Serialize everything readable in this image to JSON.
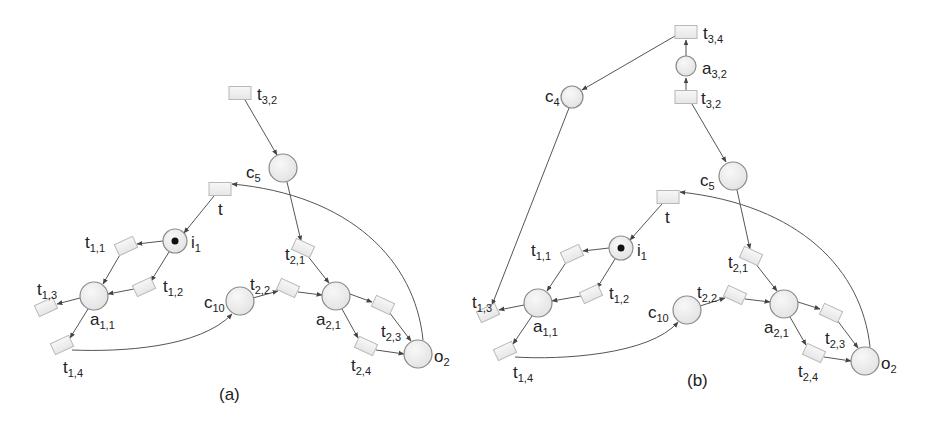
{
  "figure": {
    "panels": [
      {
        "id": "a",
        "caption": "(a)",
        "caption_pos": [
          219,
          400
        ],
        "places": [
          {
            "id": "i1",
            "label": "i",
            "sub": "1",
            "x": 175,
            "y": 241,
            "r": 12,
            "token": true,
            "lx": 191,
            "ly": 248
          },
          {
            "id": "c5",
            "label": "c",
            "sub": "5",
            "x": 283,
            "y": 168,
            "r": 14,
            "token": false,
            "lx": 246,
            "ly": 178
          },
          {
            "id": "a11",
            "label": "a",
            "sub": "1,1",
            "x": 94,
            "y": 296,
            "r": 14,
            "token": false,
            "lx": 90,
            "ly": 325
          },
          {
            "id": "c10",
            "label": "c",
            "sub": "10",
            "x": 240,
            "y": 301,
            "r": 14,
            "token": false,
            "lx": 204,
            "ly": 308
          },
          {
            "id": "a21",
            "label": "a",
            "sub": "2,1",
            "x": 336,
            "y": 296,
            "r": 14,
            "token": false,
            "lx": 316,
            "ly": 325
          },
          {
            "id": "o2",
            "label": "o",
            "sub": "2",
            "x": 418,
            "y": 354,
            "r": 14,
            "token": false,
            "lx": 434,
            "ly": 362
          }
        ],
        "transitions": [
          {
            "id": "t32",
            "label": "t",
            "sub": "3,2",
            "x": 240,
            "y": 93,
            "w": 22,
            "h": 13,
            "rot": 0,
            "lx": 257,
            "ly": 100
          },
          {
            "id": "t",
            "label": "t",
            "sub": "",
            "x": 220,
            "y": 189,
            "w": 22,
            "h": 13,
            "rot": 0,
            "lx": 218,
            "ly": 215
          },
          {
            "id": "t11",
            "label": "t",
            "sub": "1,1",
            "x": 126,
            "y": 246,
            "w": 20,
            "h": 12,
            "rot": -25,
            "lx": 85,
            "ly": 248
          },
          {
            "id": "t12",
            "label": "t",
            "sub": "1,2",
            "x": 144,
            "y": 287,
            "w": 20,
            "h": 12,
            "rot": -25,
            "lx": 163,
            "ly": 292
          },
          {
            "id": "t13",
            "label": "t",
            "sub": "1,3",
            "x": 46,
            "y": 307,
            "w": 20,
            "h": 12,
            "rot": -25,
            "lx": 37,
            "ly": 295
          },
          {
            "id": "t14",
            "label": "t",
            "sub": "1,4",
            "x": 62,
            "y": 345,
            "w": 20,
            "h": 12,
            "rot": -25,
            "lx": 63,
            "ly": 373
          },
          {
            "id": "t21",
            "label": "t",
            "sub": "2,1",
            "x": 303,
            "y": 248,
            "w": 20,
            "h": 12,
            "rot": 25,
            "lx": 285,
            "ly": 260
          },
          {
            "id": "t22",
            "label": "t",
            "sub": "2,2",
            "x": 288,
            "y": 288,
            "w": 20,
            "h": 12,
            "rot": 25,
            "lx": 250,
            "ly": 290
          },
          {
            "id": "t23",
            "label": "t",
            "sub": "2,3",
            "x": 383,
            "y": 305,
            "w": 20,
            "h": 12,
            "rot": 25,
            "lx": 381,
            "ly": 337
          },
          {
            "id": "t24",
            "label": "t",
            "sub": "2,4",
            "x": 366,
            "y": 346,
            "w": 20,
            "h": 12,
            "rot": 25,
            "lx": 351,
            "ly": 371
          }
        ],
        "arcs": [
          {
            "d": "M245,100 L277,155"
          },
          {
            "d": "M287,182 L301,241"
          },
          {
            "d": "M214,196 L184,233"
          },
          {
            "d": "M163,241 L137,244"
          },
          {
            "d": "M169,252 L151,281"
          },
          {
            "d": "M121,253 L103,284"
          },
          {
            "d": "M134,289 L108,294"
          },
          {
            "d": "M80,298 L57,304"
          },
          {
            "d": "M88,309 L70,338"
          },
          {
            "d": "M72,350 C120,352 200,348 232,314"
          },
          {
            "d": "M253,298 L278,291"
          },
          {
            "d": "M298,292 L322,295"
          },
          {
            "d": "M307,255 L329,283"
          },
          {
            "d": "M350,294 L372,302"
          },
          {
            "d": "M342,309 L358,338"
          },
          {
            "d": "M389,312 L411,341"
          },
          {
            "d": "M376,350 L404,354"
          },
          {
            "d": "M423,340 C415,260 350,195 232,184"
          }
        ]
      },
      {
        "id": "b",
        "caption": "(b)",
        "caption_pos": [
          687,
          386
        ],
        "places": [
          {
            "id": "i1",
            "label": "i",
            "sub": "1",
            "x": 621,
            "y": 248,
            "r": 12,
            "token": true,
            "lx": 637,
            "ly": 256
          },
          {
            "id": "c4",
            "label": "c",
            "sub": "4",
            "x": 572,
            "y": 97,
            "r": 11,
            "token": false,
            "lx": 545,
            "ly": 102
          },
          {
            "id": "a32",
            "label": "a",
            "sub": "3,2",
            "x": 686,
            "y": 66,
            "r": 10,
            "token": false,
            "lx": 702,
            "ly": 74
          },
          {
            "id": "c5",
            "label": "c",
            "sub": "5",
            "x": 733,
            "y": 176,
            "r": 14,
            "token": false,
            "lx": 700,
            "ly": 186
          },
          {
            "id": "a11",
            "label": "a",
            "sub": "1,1",
            "x": 538,
            "y": 303,
            "r": 14,
            "token": false,
            "lx": 533,
            "ly": 332
          },
          {
            "id": "c10",
            "label": "c",
            "sub": "10",
            "x": 687,
            "y": 310,
            "r": 14,
            "token": false,
            "lx": 648,
            "ly": 318
          },
          {
            "id": "a21",
            "label": "a",
            "sub": "2,1",
            "x": 784,
            "y": 304,
            "r": 14,
            "token": false,
            "lx": 764,
            "ly": 333
          },
          {
            "id": "o2",
            "label": "o",
            "sub": "2",
            "x": 865,
            "y": 361,
            "r": 14,
            "token": false,
            "lx": 881,
            "ly": 369
          }
        ],
        "transitions": [
          {
            "id": "t34",
            "label": "t",
            "sub": "3,4",
            "x": 686,
            "y": 32,
            "w": 22,
            "h": 13,
            "rot": 0,
            "lx": 703,
            "ly": 39
          },
          {
            "id": "t32",
            "label": "t",
            "sub": "3,2",
            "x": 686,
            "y": 97,
            "w": 22,
            "h": 13,
            "rot": 0,
            "lx": 701,
            "ly": 104
          },
          {
            "id": "t",
            "label": "t",
            "sub": "",
            "x": 668,
            "y": 197,
            "w": 22,
            "h": 13,
            "rot": 0,
            "lx": 665,
            "ly": 223
          },
          {
            "id": "t11",
            "label": "t",
            "sub": "1,1",
            "x": 572,
            "y": 254,
            "w": 20,
            "h": 12,
            "rot": -25,
            "lx": 531,
            "ly": 256
          },
          {
            "id": "t12",
            "label": "t",
            "sub": "1,2",
            "x": 591,
            "y": 294,
            "w": 20,
            "h": 12,
            "rot": -25,
            "lx": 609,
            "ly": 299
          },
          {
            "id": "t13",
            "label": "t",
            "sub": "1,3",
            "x": 488,
            "y": 313,
            "w": 20,
            "h": 12,
            "rot": -25,
            "lx": 472,
            "ly": 308
          },
          {
            "id": "t14",
            "label": "t",
            "sub": "1,4",
            "x": 505,
            "y": 351,
            "w": 20,
            "h": 12,
            "rot": -25,
            "lx": 513,
            "ly": 378
          },
          {
            "id": "t21",
            "label": "t",
            "sub": "2,1",
            "x": 751,
            "y": 256,
            "w": 20,
            "h": 12,
            "rot": 25,
            "lx": 728,
            "ly": 268
          },
          {
            "id": "t22",
            "label": "t",
            "sub": "2,2",
            "x": 735,
            "y": 295,
            "w": 20,
            "h": 12,
            "rot": 25,
            "lx": 697,
            "ly": 298
          },
          {
            "id": "t23",
            "label": "t",
            "sub": "2,3",
            "x": 831,
            "y": 313,
            "w": 20,
            "h": 12,
            "rot": 25,
            "lx": 825,
            "ly": 344
          },
          {
            "id": "t24",
            "label": "t",
            "sub": "2,4",
            "x": 814,
            "y": 353,
            "w": 20,
            "h": 12,
            "rot": 25,
            "lx": 798,
            "ly": 377
          }
        ],
        "arcs": [
          {
            "d": "M675,36 L582,90"
          },
          {
            "d": "M686,56 L686,40"
          },
          {
            "d": "M686,90 L686,78"
          },
          {
            "d": "M692,104 L726,162"
          },
          {
            "d": "M737,190 L750,249"
          },
          {
            "d": "M569,108 L492,305"
          },
          {
            "d": "M662,204 L630,240"
          },
          {
            "d": "M609,248 L583,251"
          },
          {
            "d": "M615,259 L597,288"
          },
          {
            "d": "M567,261 L547,291"
          },
          {
            "d": "M581,296 L552,301"
          },
          {
            "d": "M524,305 L499,310"
          },
          {
            "d": "M532,316 L513,344"
          },
          {
            "d": "M515,357 C560,360 650,355 678,322"
          },
          {
            "d": "M700,306 L725,298"
          },
          {
            "d": "M745,299 L770,302"
          },
          {
            "d": "M755,263 L777,291"
          },
          {
            "d": "M798,302 L820,309"
          },
          {
            "d": "M790,317 L806,345"
          },
          {
            "d": "M837,320 L858,348"
          },
          {
            "d": "M824,357 L851,361"
          },
          {
            "d": "M870,347 C862,270 800,205 680,192"
          }
        ]
      }
    ]
  }
}
